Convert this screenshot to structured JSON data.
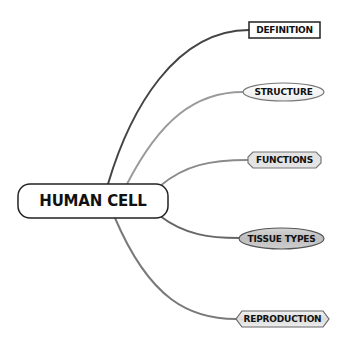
{
  "diagram": {
    "type": "mind-map",
    "root": {
      "id": "human-cell",
      "label": "HUMAN CELL"
    },
    "branches": [
      {
        "id": "definition",
        "label": "DEFINITION",
        "shape": "rectangle",
        "line_color": "#444444"
      },
      {
        "id": "structure",
        "label": "STRUCTURE",
        "shape": "ellipse",
        "line_color": "#999999"
      },
      {
        "id": "functions",
        "label": "FUNCTIONS",
        "shape": "octagon",
        "line_color": "#8a8a8a"
      },
      {
        "id": "tissue-types",
        "label": "TISSUE TYPES",
        "shape": "ellipse-shaded",
        "line_color": "#666666"
      },
      {
        "id": "reproduction",
        "label": "REPRODUCTION",
        "shape": "hexagon",
        "line_color": "#7a7a7a"
      }
    ]
  }
}
